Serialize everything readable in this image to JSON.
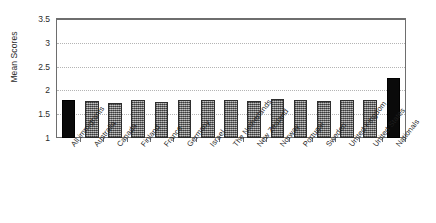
{
  "chart_data": {
    "type": "bar",
    "title": "",
    "xlabel": "",
    "ylabel": "Mean Scores",
    "ylim": [
      1,
      3.5
    ],
    "yticks": [
      "1",
      "1.5",
      "2",
      "2.5",
      "3",
      "3.5"
    ],
    "ytick_values": [
      1,
      1.5,
      2,
      2.5,
      3,
      3.5
    ],
    "grid": true,
    "legend": "none",
    "categories": [
      "All immigrants",
      "Australia",
      "Canada",
      "Finland",
      "France",
      "Germany",
      "Israel",
      "The Netherlands",
      "New Zealand",
      "Norway",
      "Portugal",
      "Sweden",
      "United Kingdom",
      "United States",
      "Nationals"
    ],
    "values": [
      1.79,
      1.78,
      1.74,
      1.8,
      1.75,
      1.79,
      1.8,
      1.79,
      1.78,
      1.81,
      1.79,
      1.78,
      1.79,
      1.8,
      2.26
    ],
    "bar_styles": [
      "black",
      "gray",
      "gray",
      "gray",
      "gray",
      "gray",
      "gray",
      "gray",
      "gray",
      "gray",
      "gray",
      "gray",
      "gray",
      "gray",
      "black"
    ],
    "colors": {
      "black_bar": "#0a0a0a",
      "gray_bar": "#8d8d8d",
      "bar_border": "#2e2e2e",
      "gridline": "#b4b4b4",
      "frame": "#6e6e6e",
      "text": "#1f1f1f",
      "background": "#ffffff"
    }
  }
}
